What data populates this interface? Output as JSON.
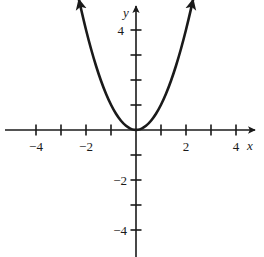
{
  "figure": {
    "background_color": "#ffffff",
    "ink_color": "#1a1a1a",
    "width": 264,
    "height": 257
  },
  "chart_data": {
    "type": "line",
    "title": "",
    "subtitle": "",
    "xlabel": "x",
    "ylabel": "y",
    "function": "y = x^2",
    "xlim": [
      -5.2,
      4.9
    ],
    "ylim": [
      -5.1,
      5.1
    ],
    "grid": false,
    "legend": false,
    "axes_style": "cartesian-crosshair-with-arrowheads",
    "units_per_tick": 1,
    "pixels_per_unit": 25,
    "origin_px": {
      "x": 136,
      "y": 130
    },
    "x_ticks": [
      -4,
      -3,
      -2,
      -1,
      1,
      2,
      3,
      4
    ],
    "x_tick_labels": [
      {
        "value": -4,
        "text": "−4"
      },
      {
        "value": -2,
        "text": "−2"
      },
      {
        "value": 2,
        "text": "2"
      },
      {
        "value": 4,
        "text": "4"
      }
    ],
    "y_ticks": [
      4,
      3,
      2,
      1,
      -1,
      -2,
      -3,
      -4
    ],
    "y_tick_labels": [
      {
        "value": 4,
        "text": "4"
      },
      {
        "value": -2,
        "text": "−2"
      },
      {
        "value": -4,
        "text": "−4"
      }
    ],
    "series": [
      {
        "name": "y = x^2",
        "color": "#1a1a1a",
        "line_width": 2.6,
        "arrow_start": true,
        "arrow_end": true,
        "x": [
          -2.28,
          -2.1,
          -1.9,
          -1.7,
          -1.5,
          -1.3,
          -1.1,
          -0.9,
          -0.7,
          -0.5,
          -0.3,
          -0.15,
          0,
          0.15,
          0.3,
          0.5,
          0.7,
          0.9,
          1.1,
          1.3,
          1.5,
          1.7,
          1.9,
          2.1,
          2.28
        ],
        "y": [
          5.2,
          4.41,
          3.61,
          2.89,
          2.25,
          1.69,
          1.21,
          0.81,
          0.49,
          0.25,
          0.09,
          0.0225,
          0,
          0.0225,
          0.09,
          0.25,
          0.49,
          0.81,
          1.21,
          1.69,
          2.25,
          2.89,
          3.61,
          4.41,
          5.2
        ]
      }
    ]
  },
  "labels": {
    "x_axis": "x",
    "y_axis": "y",
    "x_neg4": "−4",
    "x_neg2": "−2",
    "x_pos2": "2",
    "x_pos4": "4",
    "y_pos4": "4",
    "y_neg2": "−2",
    "y_neg4": "−4"
  }
}
